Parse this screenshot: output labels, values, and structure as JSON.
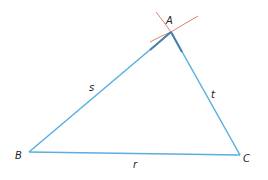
{
  "diagram": {
    "type": "triangle-construction",
    "vertices": {
      "A": {
        "label": "A",
        "x": 171,
        "y": 32
      },
      "B": {
        "label": "B",
        "x": 29,
        "y": 152
      },
      "C": {
        "label": "C",
        "x": 240,
        "y": 155
      }
    },
    "sides": {
      "s": {
        "label": "s",
        "from": "B",
        "to": "A"
      },
      "t": {
        "label": "t",
        "from": "A",
        "to": "C"
      },
      "r": {
        "label": "r",
        "from": "B",
        "to": "C"
      }
    },
    "colors": {
      "side": "#5aaee0",
      "side_dark": "#4a7fa8",
      "arc": "#d9826a",
      "text": "#222222"
    }
  }
}
